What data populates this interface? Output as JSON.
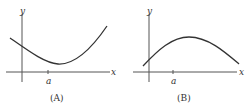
{
  "panels": [
    {
      "caption": "(A)",
      "x_label": "x",
      "y_label": "y",
      "tick_label": "a",
      "description": "Concave-up curve, decreasing at x = a, minimum to the right of a"
    },
    {
      "caption": "(B)",
      "x_label": "x",
      "y_label": "y",
      "tick_label": "a",
      "description": "Concave-down curve, increasing at x = a, maximum to the right of a"
    }
  ],
  "colors": {
    "axis": "#555555",
    "curve": "#333333",
    "text": "#333333"
  }
}
